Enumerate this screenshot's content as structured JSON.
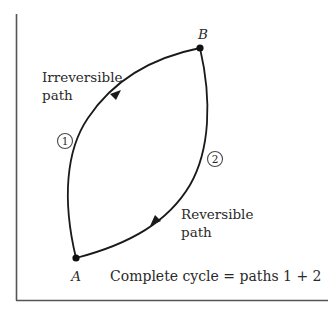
{
  "diagram": {
    "type": "thermodynamic cycle diagram",
    "colors": {
      "line": "#1a1a1a",
      "axis": "#555555",
      "text": "#2a2a2a",
      "circle": "#4a4a4a",
      "background": "#ffffff"
    },
    "axes": {
      "x_axis": {
        "label": ""
      },
      "y_axis": {
        "label": ""
      }
    },
    "points": {
      "A": {
        "label": "A"
      },
      "B": {
        "label": "B"
      }
    },
    "paths": [
      {
        "id": 1,
        "number_label": "1",
        "line1": "Irreversible",
        "line2": "path",
        "direction": "A to B"
      },
      {
        "id": 2,
        "number_label": "2",
        "line1": "Reversible",
        "line2": "path",
        "direction": "B to A"
      }
    ],
    "caption": "Complete cycle = paths 1 + 2"
  }
}
